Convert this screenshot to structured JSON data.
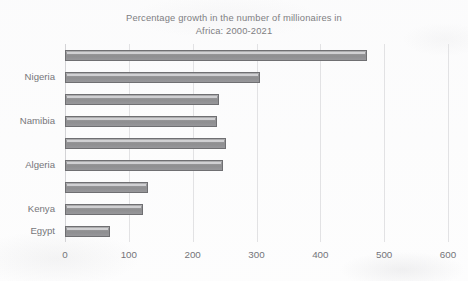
{
  "chart_data": {
    "type": "bar",
    "orientation": "horizontal",
    "title": "Percentage growth in the number of millionaires in\nAfrica: 2000-2021",
    "xlabel": "",
    "ylabel": "",
    "xlim": [
      0,
      600
    ],
    "xticks": [
      "0",
      "100",
      "200",
      "300",
      "400",
      "500",
      "600"
    ],
    "xtick_values": [
      0,
      100,
      200,
      300,
      400,
      500,
      600
    ],
    "grid": true,
    "legend": false,
    "categories": [
      "",
      "Nigeria",
      "",
      "Namibia",
      "",
      "Algeria",
      "",
      "Kenya",
      "Egypt"
    ],
    "visible_ytick_labels": [
      "Nigeria",
      "Namibia",
      "Algeria",
      "Kenya",
      "Egypt"
    ],
    "values": [
      473,
      306,
      242,
      238,
      253,
      248,
      130,
      122,
      70
    ],
    "bar_count": 9
  },
  "style": {
    "bar_fill": "#8e8e90",
    "bar_border": "#6f6f72",
    "grid_color": "#e2e2e4",
    "text_color": "#76767a",
    "title_color": "#7e7e82",
    "background": "#fdfdfd"
  }
}
